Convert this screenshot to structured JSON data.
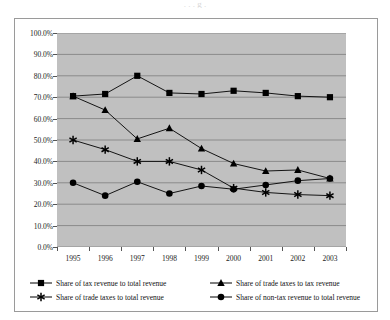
{
  "title_sliver": ". . . g .",
  "chart_data": {
    "type": "line",
    "title": "",
    "xlabel": "",
    "ylabel": "",
    "ylim": [
      0,
      100
    ],
    "ytick_step": 10,
    "grid": true,
    "legend_position": "bottom",
    "categories": [
      "1995",
      "1996",
      "1997",
      "1998",
      "1999",
      "2000",
      "2001",
      "2002",
      "2003"
    ],
    "ytick_labels": [
      "0.0%",
      "10.0%",
      "20.0%",
      "30.0%",
      "40.0%",
      "50.0%",
      "60.0%",
      "70.0%",
      "80.0%",
      "90.0%",
      "100.0%"
    ],
    "series": [
      {
        "name": "Share of tax revenue to total revenue",
        "marker": "square",
        "values": [
          70.5,
          71.5,
          80.0,
          72.0,
          71.5,
          73.0,
          72.0,
          70.5,
          70.0
        ]
      },
      {
        "name": "Share of trade taxes to tax revenue",
        "marker": "triangle",
        "values": [
          70.5,
          64.0,
          50.5,
          55.5,
          46.0,
          39.0,
          35.5,
          36.0,
          32.0
        ]
      },
      {
        "name": "Share of trade taxes to total revenue",
        "marker": "asterisk",
        "values": [
          50.0,
          45.5,
          40.0,
          40.0,
          36.0,
          27.5,
          25.5,
          24.5,
          24.0
        ]
      },
      {
        "name": "Share of non-tax revenue to total revenue",
        "marker": "circle",
        "values": [
          30.0,
          24.0,
          30.5,
          25.0,
          28.5,
          27.0,
          29.0,
          31.0,
          32.0
        ]
      }
    ]
  },
  "colors": {
    "plot_background": "#c0c0c0",
    "gridline": "#8a8a8a",
    "series_line": "#000000",
    "frame": "#9a9a9a",
    "text": "#222222"
  }
}
